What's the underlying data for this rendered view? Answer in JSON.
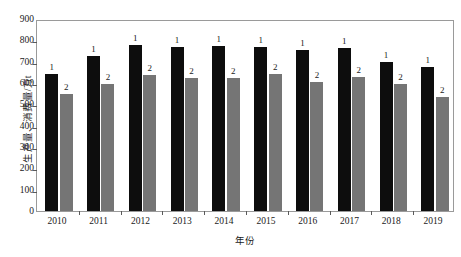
{
  "chart_data": {
    "type": "bar",
    "title": "",
    "subtitle": "",
    "xlabel": "年份",
    "ylabel": "生产量、消费量/万t",
    "categories": [
      "2010",
      "2011",
      "2012",
      "2013",
      "2014",
      "2015",
      "2016",
      "2017",
      "2018",
      "2019"
    ],
    "ylim": [
      0,
      900
    ],
    "yticks": [
      0,
      100,
      200,
      300,
      400,
      500,
      600,
      700,
      800,
      900
    ],
    "ytick_labels": [
      "0",
      "100",
      "200",
      "300",
      "400",
      "500",
      "600",
      "700",
      "800",
      "900"
    ],
    "grid": false,
    "legend_position": "inline-data-labels",
    "series": [
      {
        "name": "1",
        "label": "1",
        "color": "#0d0d0d",
        "values": [
          642,
          726,
          780,
          769,
          774,
          767,
          755,
          762,
          699,
          677
        ]
      },
      {
        "name": "2",
        "label": "2",
        "color": "#757575",
        "values": [
          548,
          597,
          639,
          623,
          622,
          640,
          604,
          630,
          597,
          536
        ]
      }
    ],
    "annotations": [
      "Each black bar is annotated with the numeral 1 above it",
      "Each gray bar is annotated with the numeral 2 above it"
    ]
  },
  "colors": {
    "series1": "#0d0d0d",
    "series2": "#757575",
    "frame": "#9a9a9a",
    "text": "#1a1a1a",
    "background": "#ffffff"
  }
}
